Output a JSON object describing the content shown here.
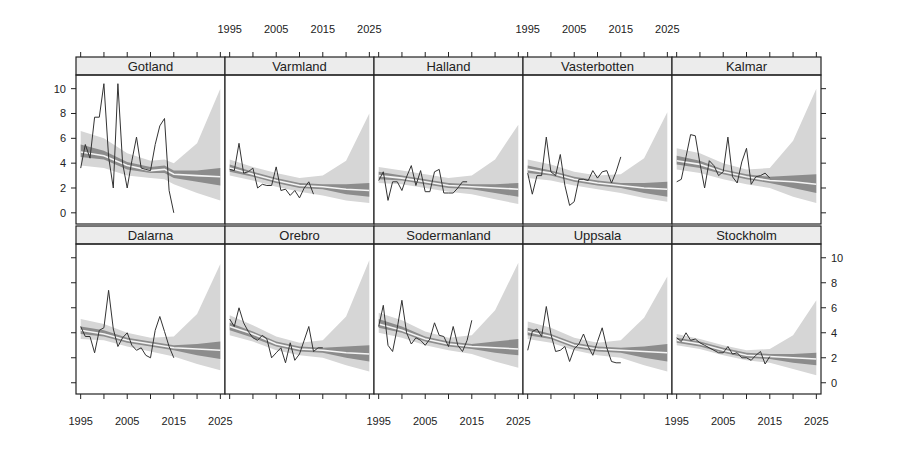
{
  "chart_data": {
    "type": "line",
    "title": "",
    "xlabel": "",
    "ylabel": "",
    "layout": {
      "columns": 5,
      "rows": 2,
      "panel_style": "lattice-strip"
    },
    "x_axis": {
      "range": [
        1994,
        2026
      ],
      "ticks": [
        1995,
        2000,
        2005,
        2010,
        2015,
        2020,
        2025
      ],
      "tick_labels": [
        "1995",
        "2005",
        "2015",
        "2025"
      ],
      "labeled_ticks": [
        1995,
        2005,
        2015,
        2025
      ]
    },
    "y_axis": {
      "range": [
        -0.9,
        11.1
      ],
      "ticks": [
        0,
        2,
        4,
        6,
        8,
        10
      ],
      "tick_labels": [
        "0",
        "2",
        "4",
        "6",
        "8",
        "10"
      ]
    },
    "grid": false,
    "legend": null,
    "bands": {
      "outer_interval_color": "#d6d6d6",
      "inner_interval_color": "#8c8c8c",
      "mean_line_color": "#f4f4f4",
      "observed_line_color": "#333333"
    },
    "panels": [
      {
        "name": "Gotland",
        "row": 0,
        "col": 0,
        "observed": {
          "x": [
            1995,
            1996,
            1997,
            1998,
            1999,
            2000,
            2001,
            2002,
            2003,
            2004,
            2005,
            2006,
            2007,
            2008,
            2009,
            2010,
            2011,
            2012,
            2013,
            2014,
            2015
          ],
          "y": [
            3.6,
            5.5,
            4.4,
            7.7,
            7.7,
            10.4,
            4.5,
            2.0,
            10.4,
            4.0,
            2.0,
            4.2,
            6.1,
            3.6,
            3.5,
            3.4,
            5.5,
            7.0,
            7.6,
            1.8,
            0.0
          ]
        },
        "fit": {
          "x": [
            1995,
            2000,
            2005,
            2010,
            2013,
            2015,
            2020,
            2025
          ],
          "mean": [
            4.9,
            4.6,
            3.8,
            3.4,
            3.5,
            3.1,
            3.0,
            2.9
          ],
          "inner_lo": [
            4.5,
            4.3,
            3.5,
            3.2,
            3.2,
            2.8,
            2.5,
            2.2
          ],
          "inner_hi": [
            5.5,
            5.0,
            4.1,
            3.7,
            3.8,
            3.4,
            3.4,
            3.6
          ],
          "outer_lo": [
            3.8,
            3.6,
            3.0,
            2.8,
            2.7,
            2.3,
            1.6,
            1.0
          ],
          "outer_hi": [
            6.6,
            6.0,
            4.8,
            4.2,
            4.3,
            4.0,
            5.6,
            10.0
          ]
        }
      },
      {
        "name": "Varmland",
        "row": 0,
        "col": 1,
        "observed": {
          "x": [
            1995,
            1996,
            1997,
            1998,
            1999,
            2000,
            2001,
            2002,
            2003,
            2004,
            2005,
            2006,
            2007,
            2008,
            2009,
            2010,
            2011,
            2012,
            2013
          ],
          "y": [
            3.5,
            3.4,
            5.6,
            3.2,
            3.3,
            3.6,
            2.0,
            2.3,
            2.2,
            2.2,
            3.7,
            1.8,
            1.9,
            1.4,
            1.8,
            1.2,
            2.0,
            2.5,
            1.5
          ]
        },
        "fit": {
          "x": [
            1995,
            2000,
            2005,
            2010,
            2015,
            2020,
            2025
          ],
          "mean": [
            3.6,
            3.1,
            2.6,
            2.2,
            2.1,
            1.9,
            1.8
          ],
          "inner_lo": [
            3.3,
            2.9,
            2.4,
            2.0,
            1.9,
            1.5,
            1.3
          ],
          "inner_hi": [
            3.9,
            3.3,
            2.8,
            2.4,
            2.3,
            2.3,
            2.4
          ],
          "outer_lo": [
            3.0,
            2.6,
            2.1,
            1.7,
            1.4,
            1.0,
            0.8
          ],
          "outer_hi": [
            4.3,
            3.7,
            3.2,
            2.8,
            3.0,
            4.2,
            8.0
          ]
        }
      },
      {
        "name": "Halland",
        "row": 0,
        "col": 2,
        "observed": {
          "x": [
            1995,
            1996,
            1997,
            1998,
            1999,
            2000,
            2001,
            2002,
            2003,
            2004,
            2005,
            2006,
            2007,
            2008,
            2009,
            2010,
            2011,
            2012,
            2013,
            2014
          ],
          "y": [
            2.6,
            3.3,
            1.0,
            2.5,
            2.5,
            1.8,
            2.9,
            3.8,
            2.2,
            3.4,
            1.7,
            1.7,
            3.3,
            3.5,
            1.6,
            1.6,
            1.6,
            2.0,
            2.5,
            2.5
          ]
        },
        "fit": {
          "x": [
            1995,
            2000,
            2005,
            2010,
            2015,
            2020,
            2025
          ],
          "mean": [
            3.0,
            2.8,
            2.5,
            2.2,
            2.1,
            2.0,
            1.9
          ],
          "inner_lo": [
            2.7,
            2.6,
            2.3,
            2.0,
            1.9,
            1.6,
            1.3
          ],
          "inner_hi": [
            3.3,
            3.0,
            2.7,
            2.4,
            2.3,
            2.3,
            2.4
          ],
          "outer_lo": [
            2.4,
            2.3,
            2.0,
            1.7,
            1.5,
            1.1,
            0.7
          ],
          "outer_hi": [
            3.7,
            3.4,
            3.1,
            2.8,
            3.0,
            4.3,
            7.1
          ]
        }
      },
      {
        "name": "Vasterbotten",
        "row": 0,
        "col": 3,
        "observed": {
          "x": [
            1995,
            1996,
            1997,
            1998,
            1999,
            2000,
            2001,
            2002,
            2003,
            2004,
            2005,
            2006,
            2007,
            2008,
            2009,
            2010,
            2011,
            2012,
            2013,
            2014,
            2015
          ],
          "y": [
            3.2,
            1.5,
            3.0,
            3.0,
            6.1,
            3.3,
            3.0,
            4.7,
            2.2,
            0.6,
            0.9,
            2.7,
            2.7,
            2.6,
            3.4,
            2.8,
            3.3,
            3.4,
            2.4,
            3.3,
            4.5
          ]
        },
        "fit": {
          "x": [
            1995,
            2000,
            2005,
            2010,
            2015,
            2020,
            2025
          ],
          "mean": [
            3.5,
            3.2,
            2.7,
            2.4,
            2.2,
            2.0,
            1.9
          ],
          "inner_lo": [
            3.2,
            3.0,
            2.5,
            2.2,
            2.0,
            1.6,
            1.3
          ],
          "inner_hi": [
            3.8,
            3.4,
            2.9,
            2.6,
            2.4,
            2.4,
            2.5
          ],
          "outer_lo": [
            2.8,
            2.6,
            2.2,
            1.9,
            1.6,
            1.2,
            0.9
          ],
          "outer_hi": [
            4.3,
            3.9,
            3.3,
            3.0,
            3.1,
            4.4,
            8.1
          ]
        }
      },
      {
        "name": "Kalmar",
        "row": 0,
        "col": 4,
        "observed": {
          "x": [
            1995,
            1996,
            1997,
            1998,
            1999,
            2000,
            2001,
            2002,
            2003,
            2004,
            2005,
            2006,
            2007,
            2008,
            2009,
            2010,
            2011,
            2012,
            2013,
            2014,
            2015
          ],
          "y": [
            2.5,
            2.7,
            4.5,
            6.3,
            6.2,
            4.0,
            2.0,
            4.2,
            3.8,
            3.0,
            3.3,
            6.1,
            2.9,
            2.4,
            4.1,
            5.2,
            2.3,
            2.9,
            3.0,
            3.2,
            2.8
          ]
        },
        "fit": {
          "x": [
            1995,
            2000,
            2005,
            2010,
            2015,
            2020,
            2025
          ],
          "mean": [
            4.2,
            3.9,
            3.3,
            2.9,
            2.6,
            2.5,
            2.3
          ],
          "inner_lo": [
            3.9,
            3.6,
            3.1,
            2.7,
            2.4,
            2.0,
            1.6
          ],
          "inner_hi": [
            4.6,
            4.2,
            3.5,
            3.1,
            2.9,
            3.0,
            3.1
          ],
          "outer_lo": [
            3.5,
            3.2,
            2.7,
            2.3,
            2.0,
            1.3,
            0.8
          ],
          "outer_hi": [
            5.2,
            4.8,
            4.0,
            3.5,
            3.6,
            5.8,
            10.0
          ]
        }
      },
      {
        "name": "Dalarna",
        "row": 1,
        "col": 0,
        "observed": {
          "x": [
            1995,
            1996,
            1997,
            1998,
            1999,
            2000,
            2001,
            2002,
            2003,
            2004,
            2005,
            2006,
            2007,
            2008,
            2009,
            2010,
            2011,
            2012,
            2013,
            2014,
            2015
          ],
          "y": [
            4.5,
            3.7,
            3.7,
            2.4,
            4.2,
            4.4,
            7.4,
            4.3,
            2.9,
            3.6,
            4.0,
            3.0,
            2.6,
            2.8,
            2.2,
            2.0,
            4.2,
            5.3,
            4.1,
            2.9,
            2.0
          ]
        },
        "fit": {
          "x": [
            1995,
            2000,
            2005,
            2010,
            2015,
            2020,
            2025
          ],
          "mean": [
            4.2,
            3.9,
            3.4,
            3.1,
            2.8,
            2.7,
            2.6
          ],
          "inner_lo": [
            3.9,
            3.7,
            3.2,
            2.9,
            2.6,
            2.2,
            1.9
          ],
          "inner_hi": [
            4.5,
            4.2,
            3.6,
            3.3,
            3.0,
            3.1,
            3.3
          ],
          "outer_lo": [
            3.5,
            3.4,
            2.9,
            2.5,
            2.1,
            1.5,
            1.0
          ],
          "outer_hi": [
            5.1,
            4.7,
            4.0,
            3.6,
            3.7,
            5.5,
            9.5
          ]
        }
      },
      {
        "name": "Orebro",
        "row": 1,
        "col": 1,
        "observed": {
          "x": [
            1995,
            1996,
            1997,
            1998,
            1999,
            2000,
            2001,
            2002,
            2003,
            2004,
            2005,
            2006,
            2007,
            2008,
            2009,
            2010,
            2011,
            2012,
            2013,
            2014,
            2015
          ],
          "y": [
            5.1,
            4.5,
            6.0,
            4.8,
            4.1,
            3.6,
            3.4,
            3.8,
            3.5,
            2.0,
            2.4,
            2.8,
            1.6,
            3.2,
            1.8,
            2.3,
            3.4,
            4.5,
            2.5,
            2.8,
            2.8
          ]
        },
        "fit": {
          "x": [
            1995,
            2000,
            2005,
            2010,
            2015,
            2020,
            2025
          ],
          "mean": [
            4.5,
            3.9,
            3.1,
            2.7,
            2.6,
            2.4,
            2.3
          ],
          "inner_lo": [
            4.2,
            3.6,
            2.9,
            2.5,
            2.4,
            2.0,
            1.7
          ],
          "inner_hi": [
            4.8,
            4.1,
            3.3,
            2.9,
            2.8,
            2.9,
            3.0
          ],
          "outer_lo": [
            3.8,
            3.3,
            2.6,
            2.2,
            2.0,
            1.4,
            0.9
          ],
          "outer_hi": [
            5.4,
            4.6,
            3.7,
            3.2,
            3.4,
            5.3,
            9.8
          ]
        }
      },
      {
        "name": "Sodermanland",
        "row": 1,
        "col": 2,
        "observed": {
          "x": [
            1995,
            1996,
            1997,
            1998,
            1999,
            2000,
            2001,
            2002,
            2003,
            2004,
            2005,
            2006,
            2007,
            2008,
            2009,
            2010,
            2011,
            2012,
            2013,
            2014,
            2015
          ],
          "y": [
            4.5,
            6.2,
            3.0,
            2.5,
            4.4,
            6.6,
            4.0,
            3.1,
            3.6,
            3.4,
            3.0,
            3.5,
            4.8,
            3.8,
            3.7,
            2.9,
            4.5,
            3.0,
            2.5,
            3.4,
            5.0
          ]
        },
        "fit": {
          "x": [
            1995,
            2000,
            2005,
            2010,
            2015,
            2020,
            2025
          ],
          "mean": [
            4.7,
            4.2,
            3.5,
            3.1,
            2.9,
            2.8,
            2.7
          ],
          "inner_lo": [
            4.4,
            4.0,
            3.3,
            2.9,
            2.7,
            2.4,
            2.2
          ],
          "inner_hi": [
            5.1,
            4.5,
            3.7,
            3.3,
            3.1,
            3.3,
            3.5
          ],
          "outer_lo": [
            4.0,
            3.6,
            3.0,
            2.6,
            2.3,
            1.7,
            1.2
          ],
          "outer_hi": [
            5.6,
            5.0,
            4.1,
            3.6,
            3.8,
            5.8,
            9.6
          ]
        }
      },
      {
        "name": "Uppsala",
        "row": 1,
        "col": 3,
        "observed": {
          "x": [
            1995,
            1996,
            1997,
            1998,
            1999,
            2000,
            2001,
            2002,
            2003,
            2004,
            2005,
            2006,
            2007,
            2008,
            2009,
            2010,
            2011,
            2012,
            2013,
            2014,
            2015
          ],
          "y": [
            2.6,
            4.1,
            4.3,
            3.7,
            6.1,
            3.9,
            2.5,
            2.6,
            2.9,
            1.7,
            2.7,
            3.1,
            3.9,
            2.9,
            2.2,
            3.3,
            4.4,
            2.8,
            1.7,
            1.6,
            1.6
          ]
        },
        "fit": {
          "x": [
            1995,
            2000,
            2005,
            2010,
            2015,
            2020,
            2025
          ],
          "mean": [
            4.1,
            3.7,
            3.0,
            2.7,
            2.6,
            2.5,
            2.4
          ],
          "inner_lo": [
            3.8,
            3.5,
            2.8,
            2.5,
            2.4,
            2.0,
            1.7
          ],
          "inner_hi": [
            4.4,
            3.9,
            3.2,
            2.9,
            2.8,
            2.9,
            3.1
          ],
          "outer_lo": [
            3.5,
            3.2,
            2.6,
            2.2,
            2.0,
            1.4,
            0.9
          ],
          "outer_hi": [
            4.9,
            4.4,
            3.6,
            3.2,
            3.4,
            5.2,
            8.5
          ]
        }
      },
      {
        "name": "Stockholm",
        "row": 1,
        "col": 4,
        "observed": {
          "x": [
            1995,
            1996,
            1997,
            1998,
            1999,
            2000,
            2001,
            2002,
            2003,
            2004,
            2005,
            2006,
            2007,
            2008,
            2009,
            2010,
            2011,
            2012,
            2013,
            2014,
            2015
          ],
          "y": [
            3.6,
            3.3,
            4.0,
            3.4,
            3.5,
            3.2,
            3.0,
            2.8,
            2.6,
            2.4,
            2.4,
            2.9,
            2.3,
            2.4,
            2.0,
            2.0,
            1.8,
            2.2,
            2.5,
            1.5,
            2.1
          ]
        },
        "fit": {
          "x": [
            1995,
            2000,
            2005,
            2010,
            2015,
            2020,
            2025
          ],
          "mean": [
            3.4,
            3.1,
            2.6,
            2.2,
            2.1,
            2.0,
            1.9
          ],
          "inner_lo": [
            3.2,
            2.9,
            2.4,
            2.0,
            1.9,
            1.6,
            1.4
          ],
          "inner_hi": [
            3.6,
            3.3,
            2.8,
            2.4,
            2.3,
            2.3,
            2.4
          ],
          "outer_lo": [
            3.0,
            2.7,
            2.2,
            1.8,
            1.6,
            1.1,
            0.6
          ],
          "outer_hi": [
            3.9,
            3.5,
            3.0,
            2.6,
            2.7,
            3.8,
            6.6
          ]
        }
      }
    ]
  }
}
